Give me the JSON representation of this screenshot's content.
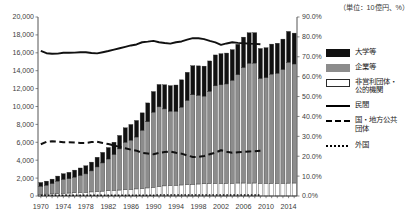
{
  "unit_note": "（単位：10億円、%）",
  "legend": {
    "items": [
      {
        "name": "universities",
        "label": "大学等",
        "swatch": "solid-black-box"
      },
      {
        "name": "companies",
        "label": "企業等",
        "swatch": "solid-gray-box"
      },
      {
        "name": "nonprofit-public",
        "label": "非営利団体・\n公的機関",
        "swatch": "white-box"
      },
      {
        "name": "private",
        "label": "民間",
        "swatch": "solid-line"
      },
      {
        "name": "government-local",
        "label": "国・地方公共\n団体",
        "swatch": "dashed-line"
      },
      {
        "name": "foreign",
        "label": "外国",
        "swatch": "dotted-line"
      }
    ]
  },
  "chart_data": {
    "type": "bar",
    "title": "",
    "xlabel": "",
    "ylabel": "",
    "y2label": "",
    "grid": false,
    "legend_position": "right",
    "ylim": [
      0,
      20000
    ],
    "y2lim": [
      0,
      90
    ],
    "ytick_labels": [
      "20,000",
      "18,000",
      "16,000",
      "14,000",
      "12,000",
      "10,000",
      "8,000",
      "6,000",
      "4,000",
      "2,000",
      "0"
    ],
    "ytick_values": [
      20000,
      18000,
      16000,
      14000,
      12000,
      10000,
      8000,
      6000,
      4000,
      2000,
      0
    ],
    "y2tick_labels": [
      "90.0%",
      "80.0%",
      "70.0%",
      "60.0%",
      "50.0%",
      "40.0%",
      "30.0%",
      "20.0%",
      "10.0%",
      "0.0%"
    ],
    "y2tick_values": [
      90,
      80,
      70,
      60,
      50,
      40,
      30,
      20,
      10,
      0
    ],
    "categories": [
      1970,
      1971,
      1972,
      1973,
      1974,
      1975,
      1976,
      1977,
      1978,
      1979,
      1980,
      1981,
      1982,
      1983,
      1984,
      1985,
      1986,
      1987,
      1988,
      1989,
      1990,
      1991,
      1992,
      1993,
      1994,
      1995,
      1996,
      1997,
      1998,
      1999,
      2000,
      2001,
      2002,
      2003,
      2004,
      2005,
      2006,
      2007,
      2008,
      2009,
      2010,
      2011,
      2012,
      2013,
      2014,
      2015
    ],
    "xtick_labels": [
      "1970",
      "1974",
      "1978",
      "1982",
      "1986",
      "1990",
      "1994",
      "1998",
      "2002",
      "2006",
      "2010",
      "2014"
    ],
    "xtick_values": [
      1970,
      1974,
      1978,
      1982,
      1986,
      1990,
      1994,
      1998,
      2002,
      2006,
      2010,
      2014
    ],
    "series": [
      {
        "name": "非営利団体・公的機関",
        "key": "nonprofit_public",
        "color": "#ffffff",
        "stack": true,
        "values": [
          190,
          210,
          235,
          265,
          300,
          330,
          360,
          390,
          420,
          455,
          500,
          545,
          585,
          630,
          665,
          700,
          740,
          790,
          840,
          900,
          970,
          1060,
          1130,
          1180,
          1200,
          1230,
          1270,
          1310,
          1340,
          1360,
          1390,
          1410,
          1420,
          1420,
          1430,
          1450,
          1450,
          1440,
          1450,
          1430,
          1420,
          1420,
          1420,
          1430,
          1440,
          1450
        ]
      },
      {
        "name": "企業等",
        "key": "companies",
        "color": "#8c8c8c",
        "stack": true,
        "values": [
          900,
          1000,
          1150,
          1400,
          1550,
          1600,
          1750,
          1900,
          2050,
          2350,
          2750,
          3150,
          3550,
          4000,
          4600,
          5300,
          5500,
          5800,
          6500,
          7400,
          8400,
          8900,
          8600,
          8300,
          8250,
          8700,
          9400,
          10000,
          9900,
          9800,
          10300,
          10900,
          11000,
          11100,
          11500,
          12100,
          12900,
          13400,
          13400,
          11700,
          11800,
          12200,
          12300,
          12700,
          13500,
          13300
        ]
      },
      {
        "name": "大学等",
        "key": "universities",
        "color": "#111111",
        "stack": true,
        "values": [
          420,
          450,
          500,
          560,
          640,
          720,
          780,
          840,
          910,
          980,
          1080,
          1180,
          1280,
          1380,
          1500,
          1620,
          1750,
          1850,
          1950,
          2100,
          2300,
          2500,
          2700,
          2850,
          2950,
          3050,
          3150,
          3250,
          3300,
          3350,
          3400,
          3450,
          3480,
          3450,
          3420,
          3400,
          3400,
          3400,
          3400,
          3350,
          3350,
          3350,
          3350,
          3400,
          3450,
          3450
        ]
      }
    ],
    "lines": [
      {
        "name": "民間",
        "key": "private",
        "style": "solid",
        "color": "#111111",
        "axis": "right",
        "unit": "%",
        "values": [
          73.0,
          71.8,
          71.5,
          71.6,
          72.0,
          72.0,
          72.1,
          72.3,
          72.3,
          71.9,
          71.7,
          72.3,
          72.9,
          73.6,
          74.3,
          75.0,
          75.7,
          76.2,
          77.3,
          77.6,
          78.0,
          77.3,
          76.9,
          76.6,
          77.3,
          77.7,
          78.6,
          79.4,
          79.3,
          78.9,
          78.0,
          77.2,
          76.0,
          76.7,
          77.3,
          77.0,
          76.8,
          76.6,
          76.5,
          76.3
        ]
      },
      {
        "name": "国・地方公共団体",
        "key": "government_local",
        "style": "dashed",
        "color": "#111111",
        "axis": "right",
        "unit": "%",
        "values": [
          26.0,
          27.2,
          27.5,
          27.4,
          27.0,
          27.0,
          26.9,
          26.7,
          26.7,
          27.1,
          27.3,
          26.7,
          26.1,
          25.4,
          24.7,
          24.0,
          23.3,
          22.8,
          21.7,
          21.4,
          21.0,
          21.7,
          22.1,
          22.4,
          21.7,
          21.3,
          20.4,
          19.6,
          19.7,
          20.1,
          21.0,
          21.8,
          23.0,
          22.3,
          21.7,
          22.0,
          22.2,
          22.4,
          22.5,
          22.7
        ]
      },
      {
        "name": "外国",
        "key": "foreign",
        "style": "dotted",
        "color": "#111111",
        "axis": "right",
        "unit": "%",
        "values": [
          0.4,
          0.4,
          0.4,
          0.4,
          0.4,
          0.4,
          0.4,
          0.4,
          0.4,
          0.4,
          0.4,
          0.4,
          0.4,
          0.4,
          0.4,
          0.4,
          0.4,
          0.4,
          0.4,
          0.4,
          0.4,
          0.5,
          0.5,
          0.5,
          0.5,
          0.5,
          0.5,
          0.5,
          0.5,
          0.5,
          0.5,
          0.5,
          0.5,
          0.5,
          0.5,
          0.5,
          0.5,
          0.5,
          0.5,
          0.5
        ]
      }
    ]
  }
}
